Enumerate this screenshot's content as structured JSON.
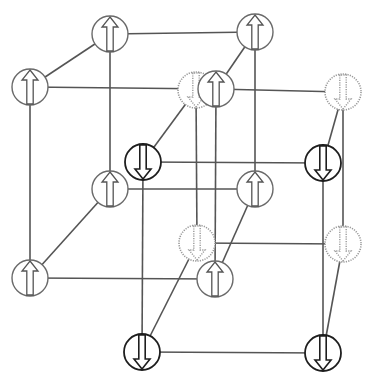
{
  "diagram": {
    "title": "",
    "colors": {
      "up_spin_stroke": "#6a6a6a",
      "down_spin_stroke": "#1e1e1e",
      "dotted_spin_stroke": "#9a9a9a",
      "edge": "#555555",
      "background": "#ffffff"
    },
    "node_radius": 18,
    "nodes": [
      {
        "id": "a1",
        "x": 110,
        "y": 34,
        "spin": "up",
        "style": "up"
      },
      {
        "id": "a2",
        "x": 255,
        "y": 32,
        "spin": "up",
        "style": "up"
      },
      {
        "id": "a3",
        "x": 30,
        "y": 87,
        "spin": "up",
        "style": "up"
      },
      {
        "id": "a5",
        "x": 110,
        "y": 189,
        "spin": "up",
        "style": "up"
      },
      {
        "id": "a6",
        "x": 255,
        "y": 189,
        "spin": "up",
        "style": "up"
      },
      {
        "id": "a7",
        "x": 30,
        "y": 278,
        "spin": "up",
        "style": "up"
      },
      {
        "id": "b1",
        "x": 196,
        "y": 90,
        "spin": "down",
        "style": "dotted"
      },
      {
        "id": "b2",
        "x": 343,
        "y": 92,
        "spin": "down",
        "style": "dotted"
      },
      {
        "id": "b5",
        "x": 197,
        "y": 243,
        "spin": "down",
        "style": "dotted"
      },
      {
        "id": "b6",
        "x": 343,
        "y": 244,
        "spin": "down",
        "style": "dotted"
      },
      {
        "id": "a4",
        "x": 216,
        "y": 89,
        "spin": "up",
        "style": "up"
      },
      {
        "id": "a8",
        "x": 215,
        "y": 279,
        "spin": "up",
        "style": "up"
      },
      {
        "id": "b3",
        "x": 143,
        "y": 162,
        "spin": "down",
        "style": "down"
      },
      {
        "id": "b4",
        "x": 323,
        "y": 163,
        "spin": "down",
        "style": "down"
      },
      {
        "id": "b7",
        "x": 142,
        "y": 352,
        "spin": "down",
        "style": "down"
      },
      {
        "id": "b8",
        "x": 323,
        "y": 353,
        "spin": "down",
        "style": "down"
      }
    ],
    "edges": [
      [
        "a1",
        "a2"
      ],
      [
        "a1",
        "a3"
      ],
      [
        "a2",
        "a4"
      ],
      [
        "a3",
        "a4"
      ],
      [
        "a3",
        "a7"
      ],
      [
        "a1",
        "a5"
      ],
      [
        "a2",
        "a6"
      ],
      [
        "a4",
        "a8"
      ],
      [
        "a5",
        "a6"
      ],
      [
        "a5",
        "a7"
      ],
      [
        "a6",
        "a8"
      ],
      [
        "a7",
        "a8"
      ],
      [
        "a4",
        "b2"
      ],
      [
        "b1",
        "b3"
      ],
      [
        "b2",
        "b4"
      ],
      [
        "b3",
        "b4"
      ],
      [
        "b1",
        "b5"
      ],
      [
        "b2",
        "b6"
      ],
      [
        "b3",
        "b7"
      ],
      [
        "b4",
        "b8"
      ],
      [
        "b5",
        "b6"
      ],
      [
        "b5",
        "b7"
      ],
      [
        "b6",
        "b8"
      ],
      [
        "b7",
        "b8"
      ]
    ]
  }
}
